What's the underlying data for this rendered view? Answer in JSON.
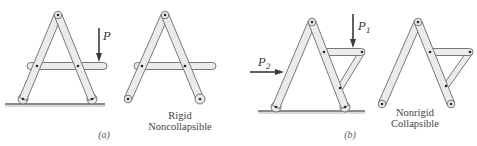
{
  "figure": {
    "panel_a": {
      "label": "(a)",
      "loaded_frame": {
        "force_label": "P"
      },
      "free_frame": {
        "caption_line1": "Rigid",
        "caption_line2": "Noncollapsible"
      }
    },
    "panel_b": {
      "label": "(b)",
      "loaded_frame": {
        "force1_label": "P",
        "force1_sub": "1",
        "force2_label": "P",
        "force2_sub": "2"
      },
      "free_frame": {
        "caption_line1": "Nonrigid",
        "caption_line2": "Collapsible"
      }
    }
  },
  "colors": {
    "member_fill": "#ebebea",
    "member_stroke": "#6a6a6a",
    "pin": "#2a2a2a",
    "ground": "#8a8a8a",
    "arrow": "#3a3a3a"
  }
}
